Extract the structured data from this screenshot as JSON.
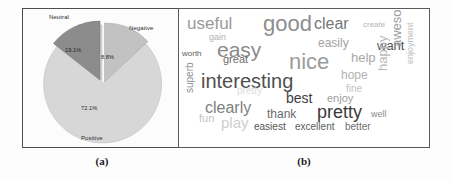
{
  "figure": {
    "panels": [
      {
        "id": "a",
        "caption": "(a)",
        "kind": "pie-chart"
      },
      {
        "id": "b",
        "caption": "(b)",
        "kind": "word-cloud"
      }
    ]
  },
  "chart_data": [
    {
      "type": "pie",
      "title": "",
      "categories": [
        "Positive",
        "Neutral",
        "Negative"
      ],
      "values": [
        72.1,
        19.1,
        8.8
      ],
      "labels": [
        "72.1%",
        "19.1%",
        "8.8%"
      ],
      "colors": [
        "#d7d7d7",
        "#8c8c8c",
        "#c2c2c2"
      ],
      "legend": "none",
      "grid": false,
      "annotations": {
        "neutral_label": "Neutral",
        "negative_label": "Negative",
        "positive_label": "Positive"
      }
    },
    {
      "type": "wordcloud",
      "title": "",
      "words": [
        {
          "text": "useful",
          "size": 17,
          "color": "#9a9a9a",
          "x": 8,
          "y": 6,
          "rot": 0
        },
        {
          "text": "good",
          "size": 22,
          "color": "#8e8e8e",
          "x": 84,
          "y": 4,
          "rot": 0
        },
        {
          "text": "clear",
          "size": 16,
          "color": "#777777",
          "x": 135,
          "y": 7,
          "rot": 0
        },
        {
          "text": "create",
          "size": 8,
          "color": "#b4b4b4",
          "x": 184,
          "y": 12,
          "rot": 0
        },
        {
          "text": "gain",
          "size": 9,
          "color": "#b0b0b0",
          "x": 30,
          "y": 24,
          "rot": 0
        },
        {
          "text": "easily",
          "size": 12,
          "color": "#a2a2a2",
          "x": 139,
          "y": 28,
          "rot": 0
        },
        {
          "text": "want",
          "size": 13,
          "color": "#555555",
          "x": 198,
          "y": 30,
          "rot": 0
        },
        {
          "text": "worth",
          "size": 8,
          "color": "#5e5e5e",
          "x": 3,
          "y": 41,
          "rot": 0
        },
        {
          "text": "easy",
          "size": 21,
          "color": "#8a8a8a",
          "x": 38,
          "y": 30,
          "rot": 0
        },
        {
          "text": "nice",
          "size": 22,
          "color": "#9b9b9b",
          "x": 110,
          "y": 42,
          "rot": 0
        },
        {
          "text": "help",
          "size": 13,
          "color": "#a6a6a6",
          "x": 172,
          "y": 42,
          "rot": 0
        },
        {
          "text": "great",
          "size": 11,
          "color": "#6d6d6d",
          "x": 44,
          "y": 45,
          "rot": 0
        },
        {
          "text": "awesome",
          "size": 13,
          "color": "#9d9d9d",
          "x": 211,
          "y": 38,
          "rot": -90
        },
        {
          "text": "enjoyment",
          "size": 9,
          "color": "#c0c0c0",
          "x": 227,
          "y": 55,
          "rot": -90
        },
        {
          "text": "interesting",
          "size": 20,
          "color": "#4f4f4f",
          "x": 22,
          "y": 62,
          "rot": 0
        },
        {
          "text": "hope",
          "size": 12,
          "color": "#b2b2b2",
          "x": 162,
          "y": 60,
          "rot": 0
        },
        {
          "text": "happy",
          "size": 13,
          "color": "#b8b8b8",
          "x": 197,
          "y": 62,
          "rot": -90
        },
        {
          "text": "fine",
          "size": 10,
          "color": "#c4c4c4",
          "x": 167,
          "y": 75,
          "rot": 0
        },
        {
          "text": "pretty",
          "size": 10,
          "color": "#dcdcdc",
          "x": 58,
          "y": 77,
          "rot": 0
        },
        {
          "text": "enjoy",
          "size": 11,
          "color": "#9e9e9e",
          "x": 148,
          "y": 84,
          "rot": 0
        },
        {
          "text": "best",
          "size": 14,
          "color": "#3d3d3d",
          "x": 107,
          "y": 82,
          "rot": 0
        },
        {
          "text": "superb",
          "size": 10,
          "color": "#8f8f8f",
          "x": 6,
          "y": 84,
          "rot": -90
        },
        {
          "text": "clearly",
          "size": 16,
          "color": "#808080",
          "x": 26,
          "y": 91,
          "rot": 0
        },
        {
          "text": "thank",
          "size": 12,
          "color": "#6a6a6a",
          "x": 88,
          "y": 99,
          "rot": 0
        },
        {
          "text": "pretty",
          "size": 18,
          "color": "#3a3a3a",
          "x": 138,
          "y": 94,
          "rot": 0
        },
        {
          "text": "well",
          "size": 9,
          "color": "#8b8b8b",
          "x": 192,
          "y": 101,
          "rot": 0
        },
        {
          "text": "fun",
          "size": 11,
          "color": "#c3c3c3",
          "x": 20,
          "y": 104,
          "rot": 0
        },
        {
          "text": "play",
          "size": 15,
          "color": "#cecece",
          "x": 42,
          "y": 106,
          "rot": 0
        },
        {
          "text": "easiest",
          "size": 10,
          "color": "#545454",
          "x": 75,
          "y": 113,
          "rot": 0
        },
        {
          "text": "excellent",
          "size": 10,
          "color": "#5c5c5c",
          "x": 116,
          "y": 113,
          "rot": 0
        },
        {
          "text": "better",
          "size": 10,
          "color": "#6f6f6f",
          "x": 166,
          "y": 113,
          "rot": 0
        }
      ]
    }
  ]
}
